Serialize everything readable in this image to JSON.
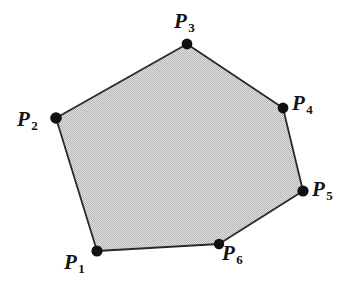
{
  "figure": {
    "kind": "convex-polygon-diagram",
    "canvas": {
      "width": 354,
      "height": 290
    },
    "background_color": "#ffffff",
    "fill_color": "#c9c9c9",
    "stroke_color": "#2a2a2a",
    "vertex_marker_color": "#111111",
    "vertex_marker_radius": 5.5,
    "vertices": [
      {
        "id": "P1",
        "label": "P",
        "subscript": "1",
        "x": 97,
        "y": 251,
        "label_x": 64,
        "label_y": 252
      },
      {
        "id": "P2",
        "label": "P",
        "subscript": "2",
        "x": 56,
        "y": 118,
        "label_x": 17,
        "label_y": 109
      },
      {
        "id": "P3",
        "label": "P",
        "subscript": "3",
        "x": 187,
        "y": 44,
        "label_x": 174,
        "label_y": 11
      },
      {
        "id": "P4",
        "label": "P",
        "subscript": "4",
        "x": 283,
        "y": 108,
        "label_x": 292,
        "label_y": 93
      },
      {
        "id": "P5",
        "label": "P",
        "subscript": "5",
        "x": 303,
        "y": 191,
        "label_x": 312,
        "label_y": 179
      },
      {
        "id": "P6",
        "label": "P",
        "subscript": "6",
        "x": 219,
        "y": 244,
        "label_x": 222,
        "label_y": 243
      }
    ],
    "polygon_points": "97,251 56,118 187,44 283,108 303,191 219,244"
  }
}
